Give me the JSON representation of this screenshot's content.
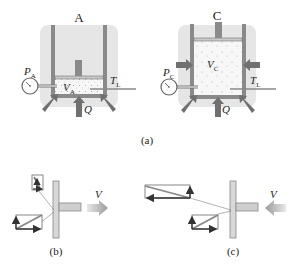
{
  "figure": {
    "panel_a": {
      "caption": "(a)",
      "cylinder_A": {
        "label": "A",
        "pressure_label": "P",
        "pressure_sub": "A",
        "volume_label": "V",
        "volume_sub": "A",
        "temperature_label": "T",
        "temperature_sub": "L",
        "heat_label": "Q"
      },
      "cylinder_C": {
        "label": "C",
        "pressure_label": "P",
        "pressure_sub": "C",
        "volume_label": "V",
        "volume_sub": "C",
        "temperature_label": "T",
        "temperature_sub": "L",
        "heat_label": "Q"
      }
    },
    "panel_b": {
      "caption": "(b)",
      "velocity_label": "V"
    },
    "panel_c": {
      "caption": "(c)",
      "velocity_label": "V"
    }
  },
  "colors": {
    "wall": "#8a8a8a",
    "wall_dark": "#6e6e6e",
    "halo": "#e4e4e4",
    "gas": "#f3f3f3",
    "piston": "#c8c8c8",
    "arrow": "#707070",
    "vector": "#333333"
  }
}
